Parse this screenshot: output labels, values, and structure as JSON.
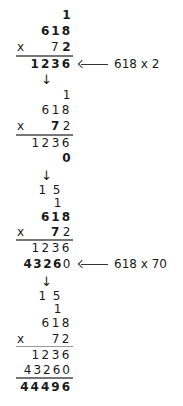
{
  "steps": [
    {
      "carry1": "",
      "carry2": "1",
      "multiplicand": "618",
      "multiplier_sign": "x",
      "multiplier": "72",
      "partial1": "1236",
      "note": "618 x 2"
    },
    {
      "carry2": "1",
      "multiplicand": "618",
      "multiplier_sign": "x",
      "multiplier": "72",
      "partial1": "1236",
      "partial2": "0"
    },
    {
      "carry1": "1 5",
      "carry2": "1",
      "multiplicand": "618",
      "multiplier_sign": "x",
      "multiplier": "72",
      "partial1": "1236",
      "partial2": "43260",
      "note": "618 x 70"
    },
    {
      "carry1": "1 5",
      "carry2": "1",
      "multiplicand": "618",
      "multiplier_sign": "x",
      "multiplier": "72",
      "partial1": "1236",
      "partial2": "43260",
      "result": "44496"
    }
  ],
  "arrow_down": "↓"
}
